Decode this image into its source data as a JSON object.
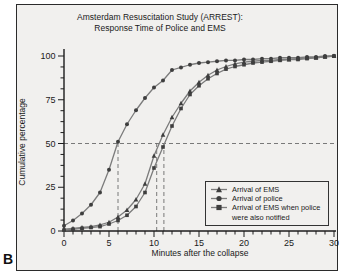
{
  "figure_label": "B",
  "colors": {
    "panel_bg": "#f1f0ee",
    "axis": "#1c1c1c",
    "series_line": "#7c7c7c",
    "marker": "#3e3e3e",
    "dashed": "#5a5a5a",
    "text": "#1a1a1a"
  },
  "chart_data": {
    "type": "line",
    "title_line1": "Amsterdam Resuscitation Study (ARREST):",
    "title_line2": "Response Time of Police and EMS",
    "xlabel": "Minutes after the collapse",
    "ylabel": "Cumulative percentage",
    "xlim": [
      0,
      30
    ],
    "ylim": [
      0,
      100
    ],
    "x_ticks": [
      0,
      5,
      10,
      15,
      20,
      25,
      30
    ],
    "y_ticks": [
      0,
      25,
      50,
      75,
      100
    ],
    "x_minor_step": 1,
    "y_minor_step": 6.25,
    "grid": false,
    "x": [
      0,
      1,
      2,
      3,
      4,
      5,
      6,
      7,
      8,
      9,
      10,
      11,
      12,
      13,
      14,
      15,
      16,
      17,
      18,
      19,
      20,
      21,
      22,
      23,
      24,
      25,
      26,
      27,
      28,
      29,
      30
    ],
    "series": [
      {
        "name": "Arrival of EMS",
        "marker": "triangle",
        "values": [
          1,
          1.5,
          2,
          2.5,
          3.5,
          5,
          8,
          12,
          18,
          27,
          43,
          55,
          65,
          73,
          80,
          85,
          89,
          92,
          94,
          95.5,
          96.5,
          97,
          97.5,
          97.5,
          98,
          98,
          98.5,
          99,
          99,
          99.5,
          100
        ]
      },
      {
        "name": "Arrival of police",
        "marker": "circle",
        "values": [
          3,
          6,
          10,
          15,
          22,
          35,
          51,
          61,
          69,
          76,
          82,
          86,
          92,
          93.5,
          95,
          96,
          96.5,
          97,
          97.5,
          97.5,
          98,
          98,
          98.5,
          98.5,
          99,
          99,
          99,
          99.5,
          99.5,
          100,
          100
        ]
      },
      {
        "name": "Arrival of EMS when police were also notified",
        "marker": "square",
        "values": [
          0.5,
          1,
          1.5,
          2,
          2.5,
          4,
          6,
          9,
          14,
          22,
          36,
          48,
          60,
          70,
          78,
          83,
          87,
          90,
          92.5,
          94,
          95,
          96,
          96.5,
          97,
          97.5,
          98,
          98,
          98.5,
          99,
          99.5,
          100
        ]
      }
    ],
    "reference_lines": {
      "horizontal_percent": 50,
      "vertical_minutes": [
        6,
        10.3,
        11.1
      ]
    },
    "legend": {
      "position": "lower right",
      "items": [
        {
          "label": "Arrival of EMS",
          "marker": "triangle"
        },
        {
          "label": "Arrival of police",
          "marker": "circle"
        },
        {
          "label": "Arrival of EMS when police were also notified",
          "marker": "square"
        }
      ]
    }
  }
}
